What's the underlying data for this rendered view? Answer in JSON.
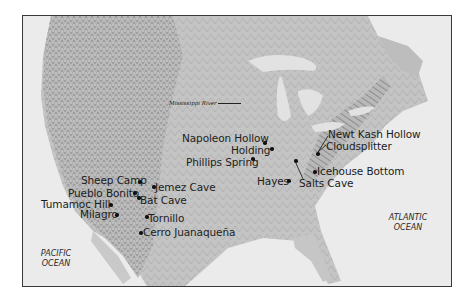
{
  "map": {
    "region": "North America (contiguous United States and northern Mexico)",
    "style": "grayscale shaded relief",
    "frame_color": "#3a3a3a",
    "water_labels": [
      {
        "name": "pacific",
        "line1": "PACIFIC",
        "line2": "OCEAN"
      },
      {
        "name": "atlantic",
        "line1": "ATLANTIC",
        "line2": "OCEAN"
      }
    ],
    "river_label": "Mississippi River",
    "sites": [
      {
        "name": "Sheep Camp"
      },
      {
        "name": "Pueblo Bonito"
      },
      {
        "name": "Jemez Cave"
      },
      {
        "name": "Bat Cave"
      },
      {
        "name": "Tumamoc Hill"
      },
      {
        "name": "Milagro"
      },
      {
        "name": "Tornillo"
      },
      {
        "name": "Cerro Juanaqueña"
      },
      {
        "name": "Napoleon Hollow"
      },
      {
        "name": "Holding"
      },
      {
        "name": "Phillips Spring"
      },
      {
        "name": "Hayes"
      },
      {
        "name": "Salts Cave"
      },
      {
        "name": "Newt Kash Hollow"
      },
      {
        "name": "Cloudsplitter"
      },
      {
        "name": "Icehouse Bottom"
      }
    ]
  }
}
